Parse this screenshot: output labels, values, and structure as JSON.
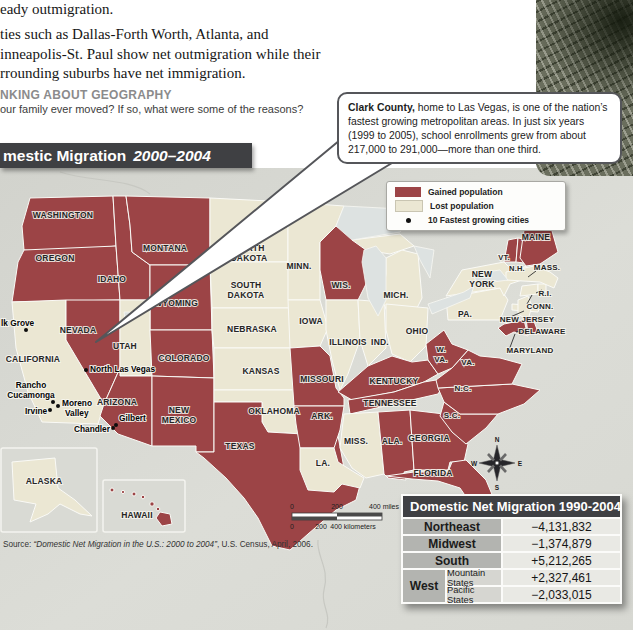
{
  "colors": {
    "gained": "#9c4446",
    "lost": "#ebe7d3",
    "ocean": "#d6d7d1",
    "lake": "#dde2e1",
    "inset_bg": "#d9dad4",
    "bar_bg": "#3f4043",
    "table_head_bg": "#3f4043",
    "table_label_bg": "#b3b4b0",
    "table_sub_bg": "#d6d6d1",
    "table_value_bg": "#e9e9e4",
    "dot": "#0d0d0d"
  },
  "text_column": {
    "line1": "eady outmigration.",
    "para_lines": [
      "ties such as Dallas-Forth Worth, Atlanta, and",
      "inneapolis-St. Paul show net outmigration while their",
      "rrounding suburbs have net immigration."
    ],
    "heading": "NKING ABOUT GEOGRAPHY",
    "question": "our family ever moved? If so, what were some of the reasons?"
  },
  "map": {
    "title": "mestic Migration",
    "title_years": "2000–2004",
    "callout": {
      "lead": "Clark County,",
      "body": " home to Las Vegas, is one of the nation’s fastest growing metropolitan areas. In just six years (1999 to 2005), school enrollments grew from about 217,000 to 291,000—more than one third."
    },
    "legend": {
      "gained_label": "Gained population",
      "lost_label": "Lost population",
      "cities_label": "10 Fastest growing cities"
    },
    "scale_miles": [
      "0",
      "200",
      "400 miles"
    ],
    "scale_km": [
      "0",
      "200",
      "400 kilometers"
    ],
    "source_prefix": "Source: ",
    "source_title": "“Domestic Net Migration in the U.S.: 2000 to 2004”",
    "source_suffix": ", U.S. Census, April, 2006.",
    "compass": {
      "n": "N",
      "e": "E",
      "s": "S",
      "w": "W"
    },
    "insets": [
      {
        "label": "ALASKA"
      },
      {
        "label": "HAWAII"
      }
    ],
    "states": [
      {
        "id": "WA",
        "name": "Washington",
        "status": "gained",
        "labels": [
          [
            "WASHINGTON",
            63,
            218
          ]
        ]
      },
      {
        "id": "OR",
        "name": "Oregon",
        "status": "gained",
        "labels": [
          [
            "OREGON",
            55,
            261
          ]
        ]
      },
      {
        "id": "CA",
        "name": "California",
        "status": "lost",
        "labels": [
          [
            "CALIFORNIA",
            33,
            362
          ]
        ]
      },
      {
        "id": "NV",
        "name": "Nevada",
        "status": "gained",
        "labels": [
          [
            "NEVADA",
            78,
            333
          ]
        ]
      },
      {
        "id": "ID",
        "name": "Idaho",
        "status": "gained",
        "labels": [
          [
            "IDAHO",
            112,
            282
          ]
        ]
      },
      {
        "id": "MT",
        "name": "Montana",
        "status": "gained",
        "labels": [
          [
            "MONTANA",
            165,
            251
          ]
        ]
      },
      {
        "id": "WY",
        "name": "Wyoming",
        "status": "gained",
        "labels": [
          [
            "WYOMING",
            176,
            306
          ]
        ]
      },
      {
        "id": "UT",
        "name": "Utah",
        "status": "lost",
        "labels": [
          [
            "UTAH",
            125,
            349
          ]
        ]
      },
      {
        "id": "CO",
        "name": "Colorado",
        "status": "gained",
        "labels": [
          [
            "COLORADO",
            184,
            361
          ]
        ]
      },
      {
        "id": "AZ",
        "name": "Arizona",
        "status": "gained",
        "labels": [
          [
            "ARIZONA",
            117,
            405
          ]
        ]
      },
      {
        "id": "NM",
        "name": "New Mexico",
        "status": "gained",
        "labels": [
          [
            "NEW",
            179,
            413
          ],
          [
            "MEXICO",
            179,
            423
          ]
        ]
      },
      {
        "id": "ND",
        "name": "North Dakota",
        "status": "lost",
        "labels": [
          [
            "NORTH",
            249,
            251
          ],
          [
            "DAKOTA",
            249,
            261
          ]
        ]
      },
      {
        "id": "SD",
        "name": "South Dakota",
        "status": "lost",
        "labels": [
          [
            "SOUTH",
            246,
            288
          ],
          [
            "DAKOTA",
            246,
            298
          ]
        ]
      },
      {
        "id": "NE",
        "name": "Nebraska",
        "status": "lost",
        "labels": [
          [
            "NEBRASKA",
            252,
            332
          ]
        ]
      },
      {
        "id": "KS",
        "name": "Kansas",
        "status": "lost",
        "labels": [
          [
            "KANSAS",
            261,
            374
          ]
        ]
      },
      {
        "id": "OK",
        "name": "Oklahoma",
        "status": "lost",
        "labels": [
          [
            "OKLAHOMA",
            274,
            414
          ]
        ]
      },
      {
        "id": "TX",
        "name": "Texas",
        "status": "gained",
        "labels": [
          [
            "TEXAS",
            240,
            449
          ]
        ]
      },
      {
        "id": "MN",
        "name": "Minnesota",
        "status": "lost",
        "labels": [
          [
            "MINN.",
            299,
            269
          ]
        ]
      },
      {
        "id": "IA",
        "name": "Iowa",
        "status": "lost",
        "labels": [
          [
            "IOWA",
            311,
            324
          ]
        ]
      },
      {
        "id": "MO",
        "name": "Missouri",
        "status": "gained",
        "labels": [
          [
            "MISSOURI",
            322,
            382
          ]
        ]
      },
      {
        "id": "AR",
        "name": "Arkansas",
        "status": "gained",
        "labels": [
          [
            "ARK.",
            322,
            419
          ]
        ]
      },
      {
        "id": "LA",
        "name": "Louisiana",
        "status": "lost",
        "labels": [
          [
            "LA.",
            323,
            466
          ]
        ]
      },
      {
        "id": "WI",
        "name": "Wisconsin",
        "status": "gained",
        "labels": [
          [
            "WIS.",
            341,
            288
          ]
        ]
      },
      {
        "id": "IL",
        "name": "Illinois",
        "status": "lost",
        "labels": [
          [
            "ILLINOIS",
            348,
            345
          ]
        ]
      },
      {
        "id": "IN",
        "name": "Indiana",
        "status": "lost",
        "labels": [
          [
            "IND.",
            380,
            345
          ]
        ]
      },
      {
        "id": "MI",
        "name": "Michigan",
        "status": "lost",
        "labels": [
          [
            "MICH.",
            396,
            298
          ]
        ]
      },
      {
        "id": "OH",
        "name": "Ohio",
        "status": "lost",
        "labels": [
          [
            "OHIO",
            417,
            334
          ]
        ]
      },
      {
        "id": "KY",
        "name": "Kentucky",
        "status": "gained",
        "labels": [
          [
            "KENTUCKY",
            394,
            384
          ]
        ]
      },
      {
        "id": "TN",
        "name": "Tennessee",
        "status": "gained",
        "labels": [
          [
            "TENNESSEE",
            390,
            406
          ]
        ]
      },
      {
        "id": "MS",
        "name": "Mississippi",
        "status": "lost",
        "labels": [
          [
            "MISS.",
            356,
            444
          ]
        ]
      },
      {
        "id": "AL",
        "name": "Alabama",
        "status": "gained",
        "labels": [
          [
            "ALA.",
            392,
            444
          ]
        ]
      },
      {
        "id": "GA",
        "name": "Georgia",
        "status": "gained",
        "labels": [
          [
            "GEORGIA",
            429,
            441
          ]
        ]
      },
      {
        "id": "FL",
        "name": "Florida",
        "status": "gained",
        "labels": [
          [
            "FLORIDA",
            433,
            476
          ]
        ]
      },
      {
        "id": "SC",
        "name": "South Carolina",
        "status": "gained",
        "fs": 8,
        "labels": [
          [
            "S.C.",
            452,
            418
          ]
        ]
      },
      {
        "id": "NC",
        "name": "North Carolina",
        "status": "gained",
        "fs": 8,
        "labels": [
          [
            "N.C.",
            463,
            391
          ]
        ]
      },
      {
        "id": "VA",
        "name": "Virginia",
        "status": "gained",
        "fs": 8,
        "labels": [
          [
            "VA.",
            468,
            365
          ]
        ]
      },
      {
        "id": "WV",
        "name": "West Virginia",
        "status": "gained",
        "fs": 8,
        "labels": [
          [
            "W.",
            441,
            352
          ],
          [
            "VA.",
            441,
            362
          ]
        ]
      },
      {
        "id": "PA",
        "name": "Pennsylvania",
        "status": "lost",
        "fs": 8.5,
        "labels": [
          [
            "PA.",
            465,
            317
          ]
        ]
      },
      {
        "id": "NY",
        "name": "New York",
        "status": "lost",
        "labels": [
          [
            "NEW",
            482,
            277
          ],
          [
            "YORK",
            482,
            287
          ]
        ]
      },
      {
        "id": "NJ",
        "name": "New Jersey",
        "status": "lost",
        "fs": 8,
        "labels": [
          [
            "NEW JERSEY",
            527,
            322
          ]
        ],
        "leader": [
          508,
          318,
          524,
          311
        ]
      },
      {
        "id": "DE",
        "name": "Delaware",
        "status": "gained",
        "fs": 8,
        "labels": [
          [
            "DELAWARE",
            542,
            334
          ]
        ],
        "leader": [
          516,
          332,
          530,
          328
        ]
      },
      {
        "id": "MD",
        "name": "Maryland",
        "status": "gained",
        "fs": 8,
        "labels": [
          [
            "MARYLAND",
            530,
            353
          ]
        ],
        "leader": [
          509,
          350,
          515,
          334
        ]
      },
      {
        "id": "CT",
        "name": "Connecticut",
        "status": "lost",
        "fs": 8,
        "labels": [
          [
            "CONN.",
            540,
            309
          ]
        ],
        "leader": [
          527,
          304,
          532,
          295
        ]
      },
      {
        "id": "RI",
        "name": "Rhode Island",
        "status": "lost",
        "fs": 8,
        "labels": [
          [
            "R.I.",
            545,
            296
          ]
        ],
        "leader": [
          536,
          293,
          542,
          290
        ]
      },
      {
        "id": "MA",
        "name": "Massachusetts",
        "status": "lost",
        "fs": 8,
        "labels": [
          [
            "MASS.",
            547,
            270
          ]
        ],
        "leader": [
          536,
          271,
          528,
          277
        ]
      },
      {
        "id": "VT",
        "name": "Vermont",
        "status": "gained",
        "fs": 7.5,
        "labels": [
          [
            "VT.",
            504,
            260
          ]
        ]
      },
      {
        "id": "NH",
        "name": "New Hampshire",
        "status": "gained",
        "fs": 7.5,
        "labels": [
          [
            "N.H.",
            517,
            271
          ]
        ]
      },
      {
        "id": "ME",
        "name": "Maine",
        "status": "gained",
        "labels": [
          [
            "MAINE",
            536,
            240
          ]
        ]
      },
      {
        "id": "AK",
        "name": "Alaska",
        "status": "lost",
        "labels": [
          [
            "ALASKA",
            44,
            484
          ]
        ]
      },
      {
        "id": "HI",
        "name": "Hawaii",
        "status": "gained",
        "labels": [
          [
            "HAWAII",
            137,
            518
          ]
        ]
      }
    ],
    "cities": [
      {
        "name": "Elk Grove",
        "lines": [
          [
            "lk Grove",
            1,
            326,
            "start"
          ]
        ],
        "dots": [
          [
            26,
            330
          ]
        ]
      },
      {
        "name": "North Las Vegas",
        "lines": [
          [
            "North Las Vegas",
            90,
            372,
            "start"
          ]
        ],
        "dots": [
          [
            86,
            370
          ]
        ]
      },
      {
        "name": "Rancho Cucamonga",
        "lines": [
          [
            "Rancho",
            31,
            388,
            "middle"
          ],
          [
            "Cucamonga",
            31,
            398,
            "middle"
          ]
        ],
        "dots": [
          [
            53,
            402
          ]
        ]
      },
      {
        "name": "Moreno Valley",
        "lines": [
          [
            "Moreno",
            62,
            406,
            "start"
          ],
          [
            "Valley",
            65,
            416,
            "start"
          ]
        ],
        "dots": [
          [
            58,
            406
          ]
        ]
      },
      {
        "name": "Irvine",
        "lines": [
          [
            "Irvine",
            25,
            414,
            "start"
          ]
        ],
        "dots": [
          [
            50,
            410
          ]
        ]
      },
      {
        "name": "Gilbert",
        "lines": [
          [
            "Gilbert",
            119,
            421,
            "start"
          ]
        ],
        "dots": [
          [
            116,
            425
          ]
        ]
      },
      {
        "name": "Chandler",
        "lines": [
          [
            "Chandler",
            74,
            432,
            "start"
          ]
        ],
        "dots": [
          [
            113,
            428
          ]
        ]
      }
    ]
  },
  "table": {
    "title": "Domestic Net Migration 1990-2004",
    "rows": [
      {
        "label": "Northeast",
        "value": "−4,131,832"
      },
      {
        "label": "Midwest",
        "value": "−1,374,879"
      },
      {
        "label": "South",
        "value": "+5,212,265"
      },
      {
        "label": "West",
        "sub": "Mountain States",
        "value": "+2,327,461"
      },
      {
        "label": "West",
        "sub": "Pacific States",
        "value": "−2,033,015"
      }
    ]
  }
}
